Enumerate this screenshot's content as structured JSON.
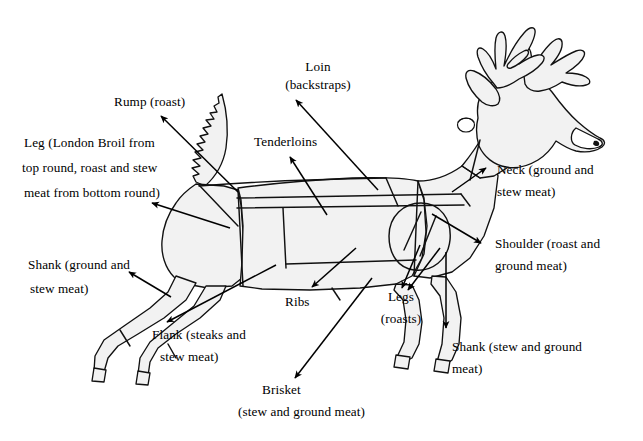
{
  "diagram": {
    "background_color": "#ffffff",
    "outline_color": "#000000",
    "body_fill_color": "#f2f2f2",
    "width": 643,
    "height": 441
  },
  "labels": {
    "rump": "Rump (roast)",
    "loin_line1": "Loin",
    "loin_line2": "(backstraps)",
    "leg_line1": "Leg (London Broil from",
    "leg_line2": "top round, roast and stew",
    "leg_line3": "meat from bottom round)",
    "tenderloins": "Tenderloins",
    "neck_line1": "Neck (ground and",
    "neck_line2": "stew meat)",
    "shoulder_line1": "Shoulder (roast and",
    "shoulder_line2": "ground meat)",
    "shank_left_line1": "Shank (ground and",
    "shank_left_line2": "stew meat)",
    "ribs": "Ribs",
    "legs_line1": "Legs",
    "legs_line2": "(roasts)",
    "flank_line1": "Flank (steaks and",
    "flank_line2": "stew meat)",
    "shank_right_line1": "Shank (stew and ground",
    "shank_right_line2": "meat)",
    "brisket_line1": "Brisket",
    "brisket_line2": "(stew and ground meat)"
  },
  "cuts": [
    {
      "name": "Rump",
      "uses": "roast"
    },
    {
      "name": "Loin",
      "uses": "backstraps"
    },
    {
      "name": "Leg",
      "uses": "London Broil from top round, roast and stew meat from bottom round"
    },
    {
      "name": "Tenderloins",
      "uses": ""
    },
    {
      "name": "Neck",
      "uses": "ground and stew meat"
    },
    {
      "name": "Shoulder",
      "uses": "roast and ground meat"
    },
    {
      "name": "Shank (hind)",
      "uses": "ground and stew meat"
    },
    {
      "name": "Ribs",
      "uses": ""
    },
    {
      "name": "Legs (front)",
      "uses": "roasts"
    },
    {
      "name": "Flank",
      "uses": "steaks and stew meat"
    },
    {
      "name": "Shank (front)",
      "uses": "stew and ground meat"
    },
    {
      "name": "Brisket",
      "uses": "stew and ground meat"
    }
  ]
}
